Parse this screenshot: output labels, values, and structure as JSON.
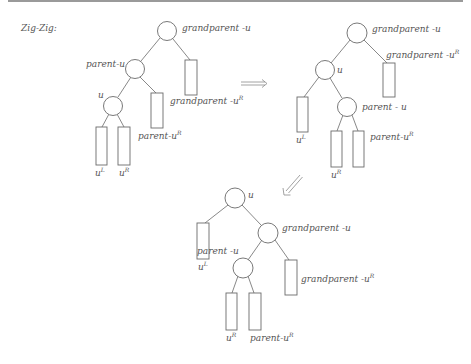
{
  "title": "Zig-Zig:",
  "colors": {
    "stroke": "#6a6a6a",
    "text": "#555555",
    "rule": "#9a9a9a"
  },
  "trees": {
    "before": {
      "grandparent": "grandparent -u",
      "parent": "parent-u",
      "u": "u",
      "uL": "u",
      "uL_sup": "L",
      "uR": "u",
      "uR_sup": "R",
      "parentR": "parent-u",
      "parentR_sup": "R",
      "grandparentR": "grandparent -u",
      "grandparentR_sup": "R"
    },
    "middle": {
      "grandparent": "grandparent -u",
      "grandparentR": "grandparent -u",
      "grandparentR_sup": "R",
      "u": "u",
      "uL": "u",
      "uL_sup": "L",
      "parent": "parent - u",
      "parentR": "parent-u",
      "parentR_sup": "R",
      "uR": "u",
      "uR_sup": "R"
    },
    "after": {
      "u": "u",
      "uL": "u",
      "uL_sup": "L",
      "grandparent": "grandparent -u",
      "parent": "parent -u",
      "grandparentR": "grandparent -u",
      "grandparentR_sup": "R",
      "uR": "u",
      "uR_sup": "R",
      "parentR": "parent-u",
      "parentR_sup": "R"
    }
  },
  "arrows": [
    {
      "name": "first-rotation",
      "direction": "right"
    },
    {
      "name": "second-rotation",
      "direction": "down-left"
    }
  ]
}
